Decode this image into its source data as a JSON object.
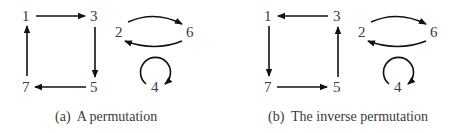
{
  "panels": [
    {
      "id": "a",
      "caption": "(a)  A permutation",
      "nodes": [
        "1",
        "3",
        "5",
        "7",
        "2",
        "6",
        "4"
      ],
      "edges": [
        [
          "1",
          "3"
        ],
        [
          "3",
          "5"
        ],
        [
          "5",
          "7"
        ],
        [
          "7",
          "1"
        ],
        [
          "2",
          "6"
        ],
        [
          "6",
          "2"
        ],
        [
          "4",
          "4"
        ]
      ]
    },
    {
      "id": "b",
      "caption": "(b)  The inverse permutation",
      "nodes": [
        "1",
        "3",
        "5",
        "7",
        "2",
        "6",
        "4"
      ],
      "edges": [
        [
          "3",
          "1"
        ],
        [
          "5",
          "3"
        ],
        [
          "7",
          "5"
        ],
        [
          "1",
          "7"
        ],
        [
          "2",
          "6"
        ],
        [
          "6",
          "2"
        ],
        [
          "4",
          "4"
        ]
      ]
    }
  ],
  "colors": {
    "text": "#3a3a3a",
    "edge": "#111111"
  }
}
